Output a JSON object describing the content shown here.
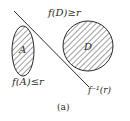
{
  "figure": {
    "caption": "(a)",
    "colors": {
      "stroke": "#2a2a2a",
      "background": "#ffffff"
    },
    "regions": [
      {
        "id": "A",
        "label": "A",
        "shape": "ellipse",
        "fill": "hatched",
        "condition_label": "f(A)≤r"
      },
      {
        "id": "D",
        "label": "D",
        "shape": "circle",
        "fill": "hatched",
        "condition_label": "f(D)≥r"
      }
    ],
    "line": {
      "label": "f⁻¹(r)"
    }
  }
}
